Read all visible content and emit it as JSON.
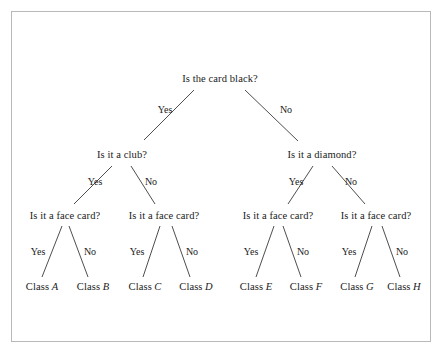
{
  "figure": {
    "type": "decision-tree",
    "background_color": "#ffffff",
    "border_color": "#b9b9b9",
    "line_color": "#3a3a3a",
    "text_color": "#1a1a1a"
  },
  "tree": {
    "root": {
      "id": "root",
      "label": "Is the card black?",
      "x": 220,
      "y": 79
    },
    "level2": [
      {
        "id": "club",
        "label": "Is it a club?",
        "x": 122,
        "y": 155
      },
      {
        "id": "diamond",
        "label": "Is it a diamond?",
        "x": 322,
        "y": 155
      }
    ],
    "level3": [
      {
        "id": "face-1",
        "label": "Is it a face card?",
        "x": 65,
        "y": 216
      },
      {
        "id": "face-2",
        "label": "Is it a face card?",
        "x": 164,
        "y": 216
      },
      {
        "id": "face-3",
        "label": "Is it a face card?",
        "x": 278,
        "y": 216
      },
      {
        "id": "face-4",
        "label": "Is it a face card?",
        "x": 376,
        "y": 216
      }
    ],
    "leaves": [
      {
        "id": "class-a",
        "prefix": "Class",
        "letter": "A",
        "x": 42,
        "y": 287
      },
      {
        "id": "class-b",
        "prefix": "Class",
        "letter": "B",
        "x": 93,
        "y": 287
      },
      {
        "id": "class-c",
        "prefix": "Class",
        "letter": "C",
        "x": 145,
        "y": 287
      },
      {
        "id": "class-d",
        "prefix": "Class",
        "letter": "D",
        "x": 196,
        "y": 287
      },
      {
        "id": "class-e",
        "prefix": "Class",
        "letter": "E",
        "x": 256,
        "y": 287
      },
      {
        "id": "class-f",
        "prefix": "Class",
        "letter": "F",
        "x": 306,
        "y": 287
      },
      {
        "id": "class-g",
        "prefix": "Class",
        "letter": "G",
        "x": 357,
        "y": 287
      },
      {
        "id": "class-h",
        "prefix": "Class",
        "letter": "H",
        "x": 404,
        "y": 287
      }
    ],
    "edges": [
      {
        "id": "root-yes",
        "from": "root",
        "to": "club",
        "x1": 194,
        "y1": 90,
        "x2": 144,
        "y2": 140
      },
      {
        "id": "root-no",
        "from": "root",
        "to": "diamond",
        "x1": 245,
        "y1": 90,
        "x2": 298,
        "y2": 141
      },
      {
        "id": "club-yes",
        "from": "club",
        "to": "face-1",
        "x1": 112,
        "y1": 166,
        "x2": 74,
        "y2": 204
      },
      {
        "id": "club-no",
        "from": "club",
        "to": "face-2",
        "x1": 131,
        "y1": 166,
        "x2": 155,
        "y2": 204
      },
      {
        "id": "diamond-yes",
        "from": "diamond",
        "to": "face-3",
        "x1": 313,
        "y1": 166,
        "x2": 288,
        "y2": 204
      },
      {
        "id": "diamond-no",
        "from": "diamond",
        "to": "face-4",
        "x1": 332,
        "y1": 166,
        "x2": 365,
        "y2": 204
      },
      {
        "id": "face1-yes",
        "from": "face-1",
        "to": "class-a",
        "x1": 62,
        "y1": 226,
        "x2": 42,
        "y2": 277
      },
      {
        "id": "face1-no",
        "from": "face-1",
        "to": "class-b",
        "x1": 69,
        "y1": 226,
        "x2": 88,
        "y2": 277
      },
      {
        "id": "face2-yes",
        "from": "face-2",
        "to": "class-c",
        "x1": 160,
        "y1": 226,
        "x2": 143,
        "y2": 277
      },
      {
        "id": "face2-no",
        "from": "face-2",
        "to": "class-d",
        "x1": 172,
        "y1": 226,
        "x2": 190,
        "y2": 277
      },
      {
        "id": "face3-yes",
        "from": "face-3",
        "to": "class-e",
        "x1": 274,
        "y1": 226,
        "x2": 256,
        "y2": 277
      },
      {
        "id": "face3-no",
        "from": "face-3",
        "to": "class-f",
        "x1": 283,
        "y1": 226,
        "x2": 301,
        "y2": 277
      },
      {
        "id": "face4-yes",
        "from": "face-4",
        "to": "class-g",
        "x1": 372,
        "y1": 226,
        "x2": 355,
        "y2": 277
      },
      {
        "id": "face4-no",
        "from": "face-4",
        "to": "class-h",
        "x1": 382,
        "y1": 226,
        "x2": 400,
        "y2": 277
      }
    ],
    "edge_labels": [
      {
        "id": "lbl-root-yes",
        "text": "Yes",
        "x": 165,
        "y": 110
      },
      {
        "id": "lbl-root-no",
        "text": "No",
        "x": 286,
        "y": 110
      },
      {
        "id": "lbl-club-yes",
        "text": "Yes",
        "x": 95,
        "y": 182
      },
      {
        "id": "lbl-club-no",
        "text": "No",
        "x": 151,
        "y": 182
      },
      {
        "id": "lbl-diamond-yes",
        "text": "Yes",
        "x": 296,
        "y": 182
      },
      {
        "id": "lbl-diamond-no",
        "text": "No",
        "x": 351,
        "y": 182
      },
      {
        "id": "lbl-face1-yes",
        "text": "Yes",
        "x": 38,
        "y": 252
      },
      {
        "id": "lbl-face1-no",
        "text": "No",
        "x": 90,
        "y": 252
      },
      {
        "id": "lbl-face2-yes",
        "text": "Yes",
        "x": 137,
        "y": 252
      },
      {
        "id": "lbl-face2-no",
        "text": "No",
        "x": 192,
        "y": 252
      },
      {
        "id": "lbl-face3-yes",
        "text": "Yes",
        "x": 251,
        "y": 252
      },
      {
        "id": "lbl-face3-no",
        "text": "No",
        "x": 303,
        "y": 252
      },
      {
        "id": "lbl-face4-yes",
        "text": "Yes",
        "x": 349,
        "y": 252
      },
      {
        "id": "lbl-face4-no",
        "text": "No",
        "x": 402,
        "y": 252
      }
    ]
  }
}
